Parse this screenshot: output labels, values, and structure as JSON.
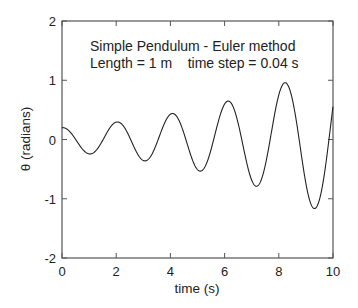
{
  "chart_data": {
    "type": "line",
    "title": "",
    "annotations": [
      "Simple Pendulum - Euler method",
      "Length = 1 m    time step = 0.04 s"
    ],
    "xlabel": "time (s)",
    "ylabel": "θ (radians)",
    "xlim": [
      0,
      10
    ],
    "ylim": [
      -2,
      2
    ],
    "xticks": [
      0,
      2,
      4,
      6,
      8,
      10
    ],
    "yticks": [
      -2,
      -1,
      0,
      1,
      2
    ],
    "grid": false,
    "legend": null,
    "series": [
      {
        "name": "θ(t)",
        "color": "#222222",
        "method": "euler",
        "params": {
          "theta0": 0.2,
          "omega0": 0,
          "g": 9.8,
          "length": 1,
          "dt": 0.04,
          "t_end": 10
        },
        "extrema": [
          {
            "t": 0.0,
            "theta": 0.2
          },
          {
            "t": 1.07,
            "theta": -0.21
          },
          {
            "t": 2.0,
            "theta": 0.31
          },
          {
            "t": 3.06,
            "theta": -0.35
          },
          {
            "t": 4.06,
            "theta": 0.46
          },
          {
            "t": 5.06,
            "theta": -0.52
          },
          {
            "t": 6.1,
            "theta": 0.68
          },
          {
            "t": 7.1,
            "theta": -0.77
          },
          {
            "t": 8.1,
            "theta": 0.99
          },
          {
            "t": 9.1,
            "theta": -1.16
          },
          {
            "t": 10.0,
            "theta": 1.34
          }
        ]
      }
    ]
  },
  "plot_box": {
    "left": 62,
    "top": 21,
    "right": 333,
    "bottom": 258
  },
  "colors": {
    "axis": "#555555",
    "line": "#222222",
    "text": "#222222"
  }
}
